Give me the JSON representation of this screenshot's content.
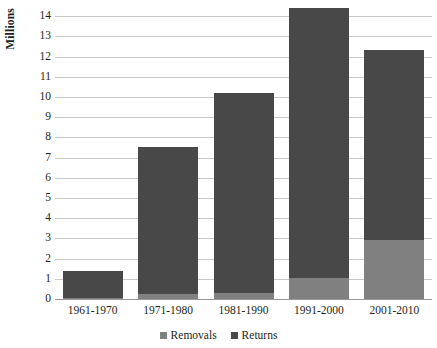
{
  "chart_data": {
    "type": "bar",
    "subtype": "stacked-bar",
    "title": "",
    "xlabel": "",
    "ylabel": "Millions",
    "categories": [
      "1961-1970",
      "1971-1980",
      "1981-1990",
      "1991-2000",
      "2001-2010"
    ],
    "series": [
      {
        "name": "Removals",
        "color": "#808080",
        "values": [
          0.05,
          0.24,
          0.28,
          1.05,
          2.9
        ]
      },
      {
        "name": "Returns",
        "color": "#484848",
        "values": [
          1.35,
          7.26,
          9.92,
          13.35,
          9.4
        ]
      }
    ],
    "totals": [
      1.4,
      7.5,
      10.2,
      14.4,
      12.3
    ],
    "ylim": [
      0,
      14.6
    ],
    "yticks": [
      0,
      1,
      2,
      3,
      4,
      5,
      6,
      7,
      8,
      9,
      10,
      11,
      12,
      13,
      14
    ],
    "ytick_labels": [
      "0",
      "1",
      "2",
      "3",
      "4",
      "5",
      "6",
      "7",
      "8",
      "9",
      "10",
      "11",
      "12",
      "13",
      "14"
    ],
    "grid": true,
    "grid_axis": "y",
    "legend": [
      "Removals",
      "Returns"
    ],
    "legend_position": "bottom"
  },
  "axis": {
    "y_title": "Millions"
  },
  "legend": {
    "items": [
      {
        "label": "Removals",
        "marker": "square-swatch-light"
      },
      {
        "label": "Returns",
        "marker": "square-swatch-dark"
      }
    ]
  },
  "colors": {
    "removals": "#808080",
    "returns": "#484848",
    "gridline": "#c9c9c9",
    "axis": "#9a9a9a",
    "text": "#231f20",
    "background": "#ffffff"
  }
}
